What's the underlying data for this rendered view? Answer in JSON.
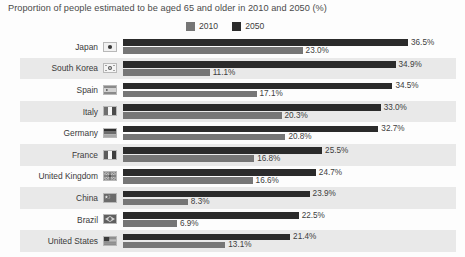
{
  "chart_data": {
    "type": "bar",
    "orientation": "horizontal",
    "title": "Proportion of people estimated to be aged 65 and older in 2010 and 2050 (%)",
    "xlabel": "",
    "ylabel": "",
    "grid": false,
    "legend_position": "top-center",
    "xlim": [
      0,
      36.5
    ],
    "categories": [
      "Japan",
      "South Korea",
      "Spain",
      "Italy",
      "Germany",
      "France",
      "United Kingdom",
      "China",
      "Brazil",
      "United States"
    ],
    "series": [
      {
        "name": "2050",
        "color": "#2b2b2b",
        "values": [
          36.5,
          34.9,
          34.5,
          33.0,
          32.7,
          25.5,
          24.7,
          23.9,
          22.5,
          21.4
        ],
        "value_labels": [
          "36.5%",
          "34.9%",
          "34.5%",
          "33.0%",
          "32.7%",
          "25.5%",
          "24.7%",
          "23.9%",
          "22.5%",
          "21.4%"
        ]
      },
      {
        "name": "2010",
        "color": "#767676",
        "values": [
          23.0,
          11.1,
          17.1,
          20.3,
          20.8,
          16.8,
          16.6,
          8.3,
          6.9,
          13.1
        ],
        "value_labels": [
          "23.0%",
          "11.1%",
          "17.1%",
          "20.3%",
          "20.8%",
          "16.8%",
          "16.6%",
          "8.3%",
          "6.9%",
          "13.1%"
        ]
      }
    ]
  },
  "legend": {
    "items": [
      {
        "label": "2010",
        "color": "#767676",
        "icon": "legend-swatch-2010"
      },
      {
        "label": "2050",
        "color": "#2b2b2b",
        "icon": "legend-swatch-2050"
      }
    ]
  },
  "rows": [
    {
      "country": "Japan",
      "flag": "flag-japan",
      "v2050": "36.5%",
      "v2010": "23.0%",
      "n2050": 36.5,
      "n2010": 23.0
    },
    {
      "country": "South Korea",
      "flag": "flag-south-korea",
      "v2050": "34.9%",
      "v2010": "11.1%",
      "n2050": 34.9,
      "n2010": 11.1
    },
    {
      "country": "Spain",
      "flag": "flag-spain",
      "v2050": "34.5%",
      "v2010": "17.1%",
      "n2050": 34.5,
      "n2010": 17.1
    },
    {
      "country": "Italy",
      "flag": "flag-italy",
      "v2050": "33.0%",
      "v2010": "20.3%",
      "n2050": 33.0,
      "n2010": 20.3
    },
    {
      "country": "Germany",
      "flag": "flag-germany",
      "v2050": "32.7%",
      "v2010": "20.8%",
      "n2050": 32.7,
      "n2010": 20.8
    },
    {
      "country": "France",
      "flag": "flag-france",
      "v2050": "25.5%",
      "v2010": "16.8%",
      "n2050": 25.5,
      "n2010": 16.8
    },
    {
      "country": "United Kingdom",
      "flag": "flag-united-kingdom",
      "v2050": "24.7%",
      "v2010": "16.6%",
      "n2050": 24.7,
      "n2010": 16.6
    },
    {
      "country": "China",
      "flag": "flag-china",
      "v2050": "23.9%",
      "v2010": "8.3%",
      "n2050": 23.9,
      "n2010": 8.3
    },
    {
      "country": "Brazil",
      "flag": "flag-brazil",
      "v2050": "22.5%",
      "v2010": "6.9%",
      "n2050": 22.5,
      "n2010": 6.9
    },
    {
      "country": "United States",
      "flag": "flag-united-states",
      "v2050": "21.4%",
      "v2010": "13.1%",
      "n2050": 21.4,
      "n2010": 13.1
    }
  ],
  "colors": {
    "series_2010": "#767676",
    "series_2050": "#2b2b2b",
    "stripe": "#e9e9e9",
    "background": "#fdfdfd",
    "text": "#3d3d3d"
  }
}
